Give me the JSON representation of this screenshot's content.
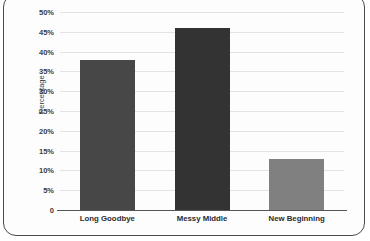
{
  "frame": {
    "title_partial": "",
    "border_color": "#4a4a4a",
    "background_color": "#fdfdfd"
  },
  "chart_data": {
    "type": "bar",
    "title": "",
    "xlabel": "",
    "ylabel": "Percentage",
    "categories": [
      "Long Goodbye",
      "Messy Middle",
      "New Beginning"
    ],
    "values": [
      38,
      46,
      13
    ],
    "value_labels": [
      "38%",
      "46%",
      "13%"
    ],
    "bar_colors": [
      "#474747",
      "#333333",
      "#808080"
    ],
    "ylim": [
      0,
      50
    ],
    "ytick_values": [
      0,
      5,
      10,
      15,
      20,
      25,
      30,
      35,
      40,
      45,
      50
    ],
    "ytick_labels": [
      "0",
      "5%",
      "10%",
      "15%",
      "20%",
      "25%",
      "30%",
      "35%",
      "40%",
      "45%",
      "50%"
    ],
    "grid": true,
    "grid_color": "#e3e3e3",
    "legend": false,
    "legend_position": "none",
    "axis_line_color": "#55565a"
  }
}
